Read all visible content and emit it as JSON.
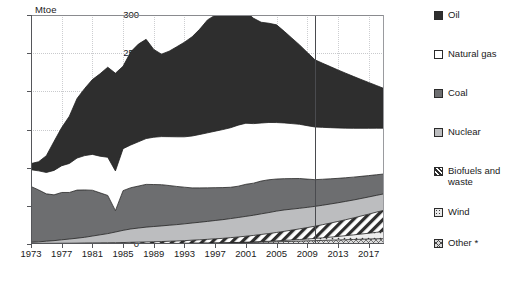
{
  "title_cut": "",
  "axis": {
    "unit_label": "Mtoe",
    "y_ticks": [
      0,
      50,
      100,
      150,
      200,
      250,
      300
    ],
    "x_ticks": [
      1973,
      1977,
      1981,
      1985,
      1989,
      1993,
      1997,
      2001,
      2005,
      2009,
      2013,
      2017
    ]
  },
  "legend": {
    "items": [
      {
        "label": "Oil",
        "pattern": "solid",
        "color": "#2e2e2e",
        "name": "oil"
      },
      {
        "label": "Natural gas",
        "pattern": "solid",
        "color": "#ffffff",
        "name": "natural-gas"
      },
      {
        "label": "Coal",
        "pattern": "solid",
        "color": "#6d6e70",
        "name": "coal"
      },
      {
        "label": "Nuclear",
        "pattern": "solid",
        "color": "#bcbdbf",
        "name": "nuclear"
      },
      {
        "label": "Biofuels and\nwaste",
        "pattern": "diagonal-hatch",
        "color": "#ffffff",
        "name": "biofuels-and-waste"
      },
      {
        "label": "Wind",
        "pattern": "sparse-dots",
        "color": "#e8e8e8",
        "name": "wind"
      },
      {
        "label": "Other *",
        "pattern": "cross-hatch",
        "color": "#d9d9d9",
        "name": "other"
      }
    ]
  },
  "forecast": {
    "divider_year": 2010
  },
  "chart_data": {
    "type": "area",
    "stacked": true,
    "title": "",
    "xlabel": "",
    "ylabel": "Mtoe",
    "ylim": [
      0,
      300
    ],
    "xlim": [
      1973,
      2019
    ],
    "grid": true,
    "legend_position": "right",
    "x": [
      1973,
      1974,
      1975,
      1976,
      1977,
      1978,
      1979,
      1980,
      1981,
      1982,
      1983,
      1984,
      1985,
      1986,
      1987,
      1988,
      1989,
      1990,
      1991,
      1992,
      1993,
      1994,
      1995,
      1996,
      1997,
      1998,
      1999,
      2000,
      2001,
      2002,
      2003,
      2004,
      2005,
      2006,
      2007,
      2008,
      2009,
      2010,
      2011,
      2012,
      2013,
      2014,
      2015,
      2016,
      2017,
      2018,
      2019
    ],
    "series": [
      {
        "name": "Other *",
        "order": 1,
        "values": [
          0.3,
          0.3,
          0.3,
          0.3,
          0.3,
          0.3,
          0.3,
          0.4,
          0.4,
          0.4,
          0.4,
          0.4,
          0.4,
          0.5,
          0.5,
          0.5,
          0.6,
          0.6,
          0.7,
          0.7,
          0.8,
          0.9,
          1.0,
          1.1,
          1.2,
          1.3,
          1.5,
          1.7,
          1.9,
          2.1,
          2.4,
          2.6,
          2.9,
          3.2,
          3.5,
          3.8,
          4.1,
          4.4,
          4.7,
          5.0,
          5.3,
          5.6,
          5.9,
          6.2,
          6.5,
          6.8,
          7.0
        ]
      },
      {
        "name": "Wind",
        "order": 2,
        "values": [
          0,
          0,
          0,
          0,
          0,
          0,
          0,
          0,
          0,
          0,
          0,
          0,
          0,
          0,
          0,
          0,
          0,
          0,
          0,
          0,
          0,
          0.1,
          0.1,
          0.1,
          0.2,
          0.2,
          0.3,
          0.4,
          0.5,
          0.6,
          0.8,
          1.0,
          1.2,
          1.5,
          1.8,
          2.1,
          2.5,
          2.9,
          3.4,
          4.0,
          4.6,
          5.3,
          6.0,
          6.8,
          7.6,
          8.5,
          9.4
        ]
      },
      {
        "name": "Biofuels and waste",
        "order": 3,
        "values": [
          0.5,
          0.5,
          0.6,
          0.6,
          0.7,
          0.7,
          0.8,
          0.9,
          1.0,
          1.1,
          1.2,
          1.3,
          1.5,
          1.7,
          1.9,
          2.1,
          2.3,
          2.6,
          2.9,
          3.2,
          3.6,
          4.0,
          4.4,
          4.9,
          5.4,
          5.9,
          6.5,
          7.1,
          7.8,
          8.5,
          9.3,
          10.1,
          11.0,
          11.9,
          12.9,
          13.9,
          14.9,
          16.0,
          17.2,
          18.4,
          19.6,
          20.9,
          22.2,
          23.6,
          25.0,
          26.4,
          27.8
        ]
      },
      {
        "name": "Nuclear",
        "order": 4,
        "values": [
          1.5,
          2.0,
          2.8,
          3.5,
          4.5,
          5.5,
          6.5,
          7.5,
          9.0,
          10.5,
          12.0,
          14.0,
          16.0,
          17.5,
          18.5,
          19.5,
          20.0,
          20.5,
          21.0,
          21.5,
          22.0,
          22.5,
          23.0,
          23.5,
          24.0,
          24.5,
          25.0,
          25.5,
          26.0,
          26.5,
          27.0,
          27.5,
          28.0,
          28.0,
          27.5,
          27.0,
          26.5,
          26.0,
          25.5,
          25.0,
          24.5,
          24.0,
          23.5,
          23.0,
          22.5,
          22.0,
          21.5
        ]
      },
      {
        "name": "Coal",
        "order": 5,
        "values": [
          73,
          68,
          62,
          60,
          62,
          61,
          63,
          62,
          60,
          55,
          50,
          28,
          52,
          54,
          55,
          56,
          55,
          54,
          52,
          50,
          48,
          46,
          45,
          44,
          43,
          42,
          41,
          41,
          42,
          42,
          43,
          43,
          42,
          41,
          40,
          39,
          37,
          35,
          34,
          33,
          32,
          31,
          30,
          29,
          28,
          27,
          26
        ]
      },
      {
        "name": "Natural gas",
        "order": 6,
        "values": [
          22,
          25,
          28,
          32,
          35,
          38,
          42,
          45,
          47,
          48,
          50,
          52,
          55,
          56,
          58,
          60,
          62,
          63,
          64,
          65,
          66,
          68,
          70,
          72,
          74,
          76,
          78,
          80,
          80,
          78,
          76,
          75,
          74,
          73,
          72,
          71,
          70,
          69,
          68,
          67,
          66,
          65,
          64,
          63,
          62,
          61,
          60
        ]
      },
      {
        "name": "Oil",
        "order": 7,
        "values": [
          8,
          12,
          22,
          38,
          50,
          62,
          78,
          88,
          98,
          108,
          118,
          128,
          108,
          122,
          128,
          130,
          115,
          108,
          112,
          118,
          124,
          130,
          138,
          148,
          152,
          150,
          148,
          152,
          146,
          138,
          132,
          130,
          128,
          120,
          112,
          104,
          96,
          88,
          84,
          80,
          76,
          72,
          68,
          64,
          60,
          56,
          52
        ]
      }
    ],
    "totals_note": "Stacked total peaks at ~280 Mtoe around 1999-2000 and at ~105 Mtoe in 1973",
    "annotations": [
      {
        "type": "vertical-line",
        "x": 2010,
        "label": "projection boundary"
      }
    ]
  }
}
